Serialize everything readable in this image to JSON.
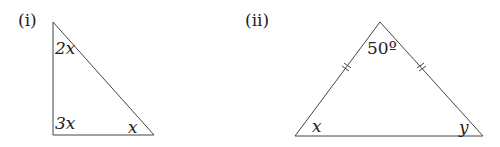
{
  "figures": [
    {
      "label": "(i)",
      "type": "right-triangle",
      "angles": {
        "top": "2x",
        "bottom_left": "3x",
        "bottom_right": "x"
      }
    },
    {
      "label": "(ii)",
      "type": "isosceles-triangle",
      "angles": {
        "apex": "50º",
        "bottom_left": "x",
        "bottom_right": "y"
      },
      "equal_sides_marked": true
    }
  ],
  "colors": {
    "line": "#444444",
    "text": "#222222"
  }
}
